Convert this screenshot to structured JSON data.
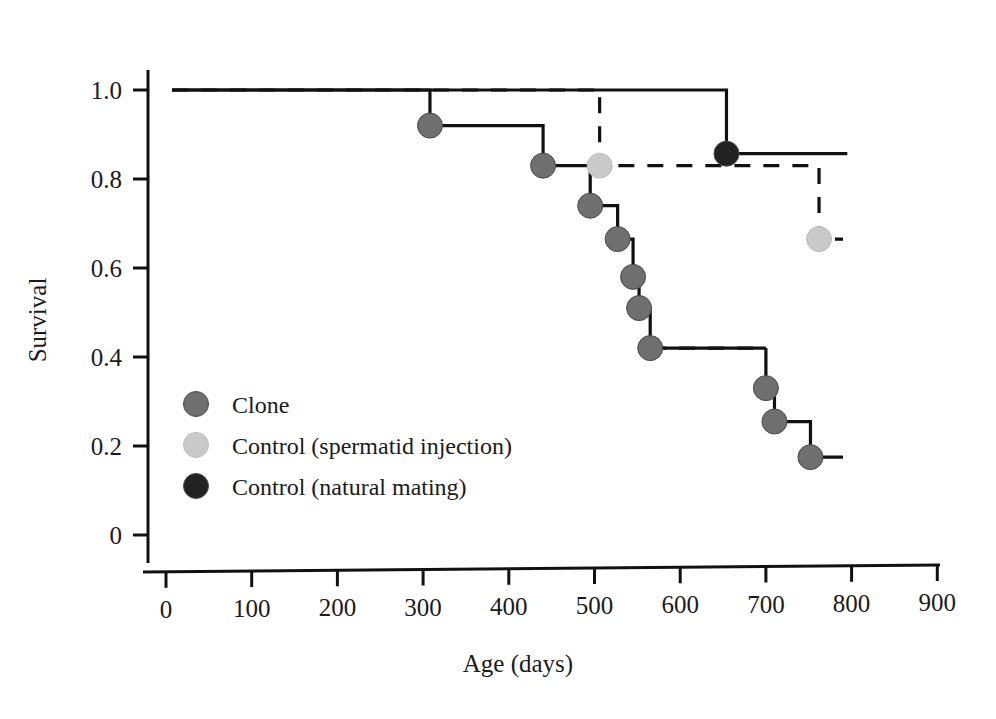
{
  "chart_data": {
    "type": "line",
    "title": "",
    "xlabel": "Age (days)",
    "ylabel": "Survival",
    "xlim": [
      0,
      950
    ],
    "ylim": [
      0,
      1.05
    ],
    "xticks": [
      0,
      100,
      200,
      300,
      400,
      500,
      600,
      700,
      800,
      900
    ],
    "xtick_labels": [
      "0",
      "100",
      "200",
      "300",
      "400",
      "500",
      "600",
      "700",
      "800",
      "900"
    ],
    "yticks": [
      0,
      0.2,
      0.4,
      0.6,
      0.8,
      1.0
    ],
    "ytick_labels": [
      "0",
      "0.2",
      "0.4",
      "0.6",
      "0.8",
      "1.0"
    ],
    "grid": false,
    "legend_position": "center-left",
    "series": [
      {
        "name": "Clone",
        "color": "#6f6f6f",
        "linestyle": "solid",
        "steps": [
          {
            "x": 7,
            "y": 1.0,
            "marker": false
          },
          {
            "x": 308,
            "y": 1.0,
            "marker": false
          },
          {
            "x": 308,
            "y": 0.92,
            "marker": true
          },
          {
            "x": 440,
            "y": 0.92,
            "marker": false
          },
          {
            "x": 440,
            "y": 0.83,
            "marker": true
          },
          {
            "x": 495,
            "y": 0.83,
            "marker": false
          },
          {
            "x": 495,
            "y": 0.74,
            "marker": true
          },
          {
            "x": 527,
            "y": 0.74,
            "marker": false
          },
          {
            "x": 527,
            "y": 0.665,
            "marker": true
          },
          {
            "x": 545,
            "y": 0.665,
            "marker": false
          },
          {
            "x": 545,
            "y": 0.58,
            "marker": true
          },
          {
            "x": 552,
            "y": 0.58,
            "marker": false
          },
          {
            "x": 552,
            "y": 0.51,
            "marker": true
          },
          {
            "x": 565,
            "y": 0.51,
            "marker": false
          },
          {
            "x": 565,
            "y": 0.42,
            "marker": true
          },
          {
            "x": 700,
            "y": 0.42,
            "marker": false,
            "dashed_from_here": true
          },
          {
            "x": 700,
            "y": 0.33,
            "marker": true
          },
          {
            "x": 710,
            "y": 0.33,
            "marker": false
          },
          {
            "x": 710,
            "y": 0.255,
            "marker": true
          },
          {
            "x": 752,
            "y": 0.255,
            "marker": false
          },
          {
            "x": 752,
            "y": 0.175,
            "marker": true
          },
          {
            "x": 790,
            "y": 0.175,
            "marker": false
          }
        ]
      },
      {
        "name": "Control (spermatid injection)",
        "color": "#c9c9c9",
        "linestyle": "dashed",
        "steps": [
          {
            "x": 7,
            "y": 1.0,
            "marker": false
          },
          {
            "x": 506,
            "y": 1.0,
            "marker": false
          },
          {
            "x": 506,
            "y": 0.83,
            "marker": true
          },
          {
            "x": 762,
            "y": 0.83,
            "marker": false
          },
          {
            "x": 762,
            "y": 0.665,
            "marker": true
          },
          {
            "x": 790,
            "y": 0.665,
            "marker": false
          }
        ]
      },
      {
        "name": "Control (natural mating)",
        "color": "#222222",
        "linestyle": "solid",
        "steps": [
          {
            "x": 7,
            "y": 1.0,
            "marker": false
          },
          {
            "x": 654,
            "y": 1.0,
            "marker": false
          },
          {
            "x": 654,
            "y": 0.857,
            "marker": true
          },
          {
            "x": 795,
            "y": 0.857,
            "marker": false
          }
        ]
      }
    ],
    "legend": [
      {
        "label": "Clone",
        "color": "#6f6f6f"
      },
      {
        "label": "Control (spermatid injection)",
        "color": "#c9c9c9"
      },
      {
        "label": "Control (natural mating)",
        "color": "#222222"
      }
    ]
  }
}
